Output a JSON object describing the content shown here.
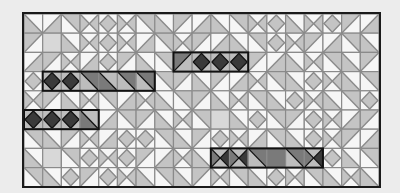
{
  "game": {
    "title": "Tile pattern puzzle",
    "columns": 19,
    "rows": 9,
    "colors": {
      "background": "#ececec",
      "board_border": "#1a1a1a",
      "grid_line": "#8a8a8a",
      "light_fill": "#c4c4c4",
      "mid_fill": "#a8a8a8",
      "white": "#f6f6f6",
      "highlight_fill": "#7a7a7a",
      "highlight_dark": "#3a3a3a",
      "highlight_border": "#111111"
    },
    "tiles": [
      "dl",
      "dr",
      "ur",
      "x",
      "dx",
      "x",
      "ur",
      "dl",
      "ul",
      "dr",
      "dl",
      "ur",
      "x",
      "dx",
      "dl",
      "x",
      "dx",
      "ul",
      "dr",
      "ul",
      "o",
      "dl",
      "x",
      "dx",
      "x",
      "dr",
      "ur",
      "x",
      "ul",
      "dr",
      "dl",
      "ur",
      "dx",
      "x",
      "ul",
      "dr",
      "ur",
      "dl",
      "dr",
      "ul",
      "x",
      "dr",
      "dx",
      "ul",
      "dl",
      "ur",
      "dl",
      "dx",
      "x",
      "ur",
      "ul",
      "dr",
      "dl",
      "x",
      "ur",
      "dl",
      "ul",
      "dx",
      "dx",
      "x",
      "ur",
      "dl",
      "dx",
      "dl",
      "ur",
      "ul",
      "dl",
      "ul",
      "dr",
      "x",
      "ur",
      "dl",
      "dx",
      "x",
      "dl",
      "ur",
      "x",
      "ul",
      "dl",
      "x",
      "ur",
      "dr",
      "x",
      "dl",
      "ur",
      "ul",
      "dl",
      "x",
      "ur",
      "dl",
      "dx",
      "x",
      "dl",
      "ur",
      "dx",
      "o",
      "dx",
      "dx",
      "dl",
      "dr",
      "ur",
      "ul",
      "dl",
      "x",
      "ur",
      "o",
      "dl",
      "dx",
      "ur",
      "ul",
      "dx",
      "x",
      "dr",
      "ul",
      "ur",
      "dl",
      "ul",
      "x",
      "dr",
      "dx",
      "dx",
      "ur",
      "dl",
      "ul",
      "dx",
      "x",
      "dr",
      "ur",
      "dl",
      "dx",
      "x",
      "ul",
      "dr",
      "dl",
      "o",
      "ur",
      "dx",
      "x",
      "dx",
      "ul",
      "dr",
      "x",
      "dl",
      "dx",
      "x",
      "ur",
      "o",
      "ur",
      "x",
      "dx",
      "dl",
      "ur",
      "ur",
      "dl",
      "dx",
      "ul",
      "dx",
      "x",
      "dl",
      "ur",
      "dl",
      "ul",
      "x",
      "ur",
      "dl",
      "dx",
      "x",
      "ur",
      "dl",
      "x",
      "dl"
    ],
    "highlighted_groups": [
      {
        "row": 2,
        "col_start": 8,
        "length": 4,
        "tiles": [
          "ul",
          "dx",
          "dx",
          "dx"
        ]
      },
      {
        "row": 3,
        "col_start": 1,
        "length": 6,
        "tiles": [
          "dx",
          "dx",
          "ur",
          "dl",
          "ur",
          "ur"
        ]
      },
      {
        "row": 5,
        "col_start": 0,
        "length": 4,
        "tiles": [
          "dx",
          "dx",
          "dx",
          "dl"
        ]
      },
      {
        "row": 7,
        "col_start": 10,
        "length": 6,
        "tiles": [
          "x",
          "x",
          "ur",
          "o",
          "ur",
          "x"
        ]
      }
    ]
  }
}
